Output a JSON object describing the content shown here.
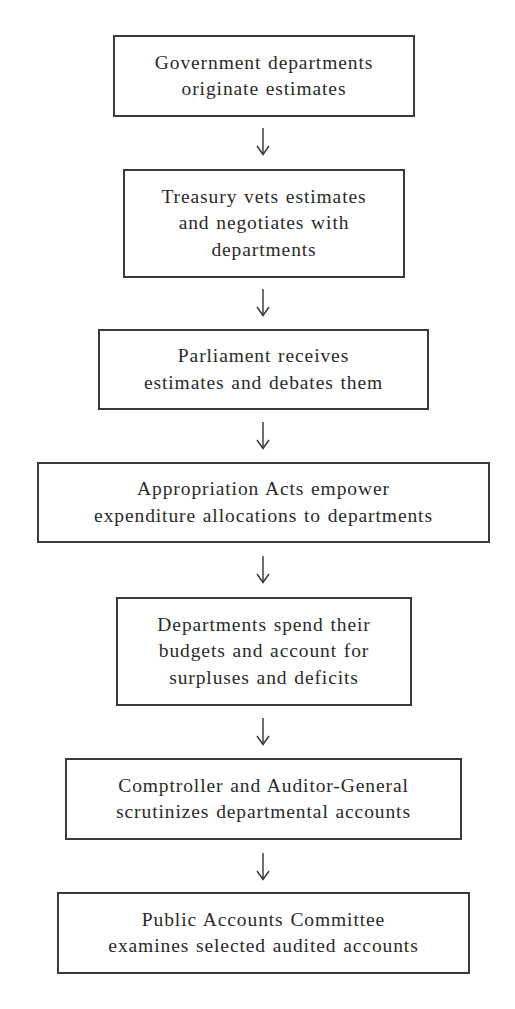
{
  "diagram": {
    "type": "flowchart",
    "direction": "top-to-bottom",
    "steps": [
      {
        "id": "step-1",
        "lines": [
          "Government departments",
          "originate estimates"
        ],
        "text": "Government departments originate estimates"
      },
      {
        "id": "step-2",
        "lines": [
          "Treasury vets estimates",
          "and negotiates with",
          "departments"
        ],
        "text": "Treasury vets estimates and negotiates with departments"
      },
      {
        "id": "step-3",
        "lines": [
          "Parliament receives",
          "estimates and debates them"
        ],
        "text": "Parliament receives estimates and debates them"
      },
      {
        "id": "step-4",
        "lines": [
          "Appropriation Acts empower",
          "expenditure allocations to departments"
        ],
        "text": "Appropriation Acts empower expenditure allocations to departments"
      },
      {
        "id": "step-5",
        "lines": [
          "Departments spend their",
          "budgets and account for",
          "surpluses and deficits"
        ],
        "text": "Departments spend their budgets and account for surpluses and deficits"
      },
      {
        "id": "step-6",
        "lines": [
          "Comptroller and Auditor-General",
          "scrutinizes departmental accounts"
        ],
        "text": "Comptroller and Auditor-General scrutinizes departmental accounts"
      },
      {
        "id": "step-7",
        "lines": [
          "Public Accounts Committee",
          "examines selected audited accounts"
        ],
        "text": "Public Accounts Committee examines selected audited accounts"
      }
    ],
    "connections": [
      {
        "from": "step-1",
        "to": "step-2",
        "icon": "down-arrow-icon"
      },
      {
        "from": "step-2",
        "to": "step-3",
        "icon": "down-arrow-icon"
      },
      {
        "from": "step-3",
        "to": "step-4",
        "icon": "down-arrow-icon"
      },
      {
        "from": "step-4",
        "to": "step-5",
        "icon": "down-arrow-icon"
      },
      {
        "from": "step-5",
        "to": "step-6",
        "icon": "down-arrow-icon"
      },
      {
        "from": "step-6",
        "to": "step-7",
        "icon": "down-arrow-icon"
      }
    ],
    "colors": {
      "border": "#3a3a3a",
      "text": "#2a2a2a",
      "background": "#ffffff"
    }
  }
}
